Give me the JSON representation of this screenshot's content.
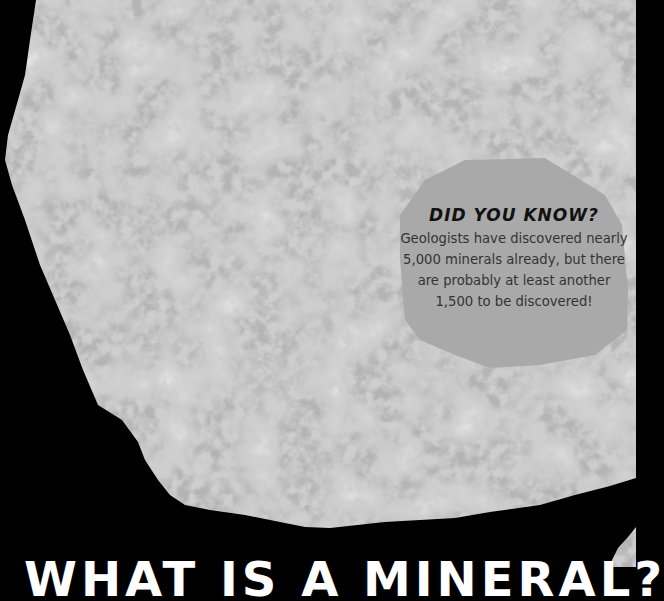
{
  "page": {
    "background_color": "#000000",
    "image": {
      "subject": "granite-rock-closeup",
      "description": "Grayscale speckled rock specimen on black background"
    }
  },
  "callout": {
    "title": "DID YOU KNOW?",
    "lines": [
      "Geologists have discovered nearly",
      "5,000 minerals already, but there",
      "are probably at least another",
      "1,500 to be discovered!"
    ],
    "background_color": "#a9a9a9"
  },
  "heading": {
    "text": "WHAT IS A MINERAL?"
  }
}
